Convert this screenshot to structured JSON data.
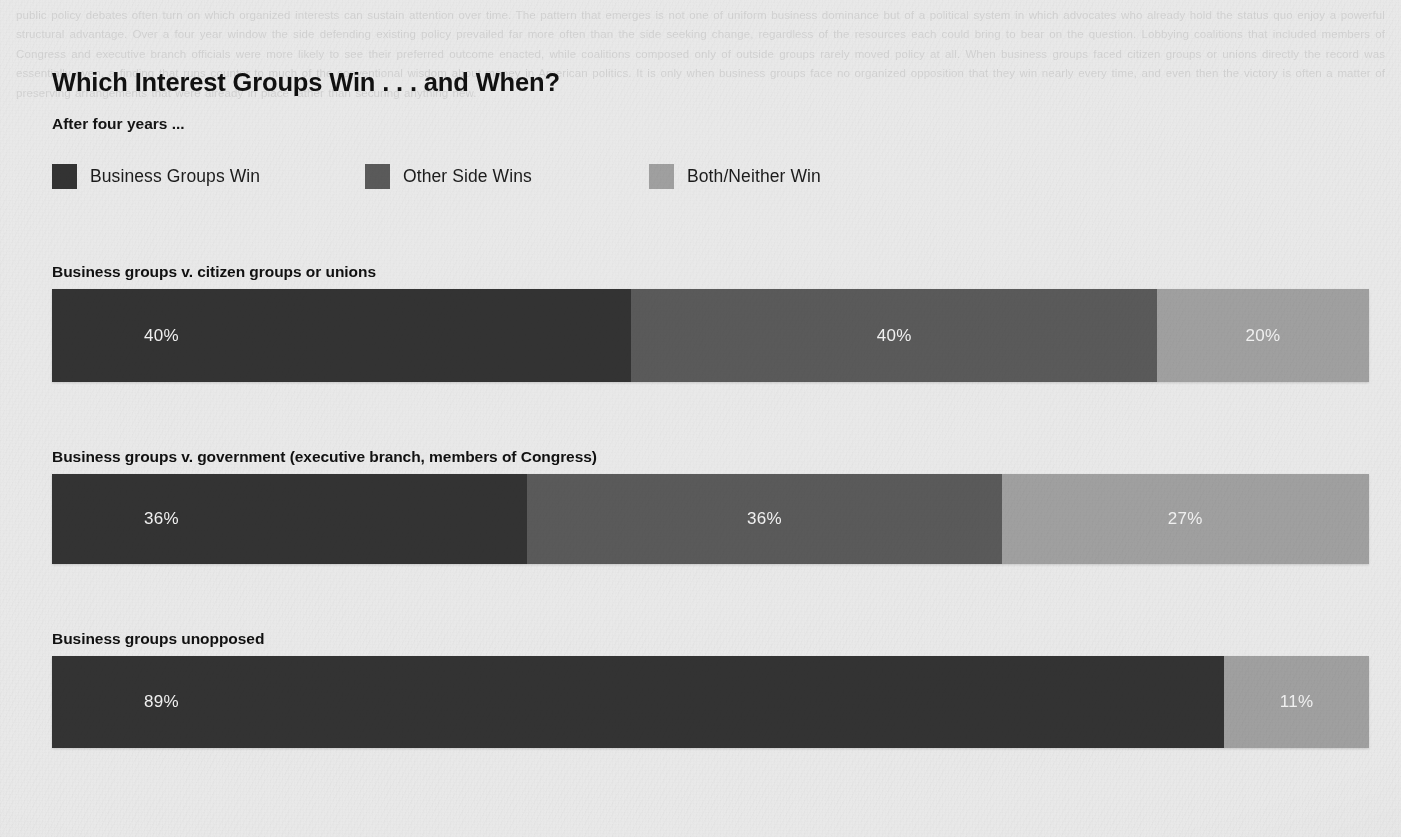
{
  "chart_data": {
    "type": "bar",
    "subtype": "stacked-horizontal-100pct",
    "title": "Which Interest Groups Win . . . and When?",
    "subtitle": "After four years ...",
    "xlabel": "",
    "ylabel": "",
    "xlim": [
      0,
      100
    ],
    "grid": false,
    "legend_position": "top",
    "value_suffix": "%",
    "categories": [
      "Business groups v. citizen groups or unions",
      "Business groups v. government (executive branch, members of Congress)",
      "Business groups unopposed"
    ],
    "series": [
      {
        "name": "Business Groups Win",
        "color": "#333333",
        "values": [
          40,
          36,
          89
        ]
      },
      {
        "name": "Other Side Wins",
        "color": "#5a5a5a",
        "values": [
          40,
          36,
          null
        ]
      },
      {
        "name": "Both/Neither Win",
        "color": "#a0a0a0",
        "values": [
          20,
          27,
          11
        ]
      }
    ],
    "rows": [
      {
        "label": "Business groups v. citizen groups or unions",
        "segments": [
          {
            "series": "Business Groups Win",
            "value": 40,
            "label": "40%",
            "color": "#333333",
            "width_pct": 44.0,
            "label_align": "left"
          },
          {
            "series": "Other Side Wins",
            "value": 40,
            "label": "40%",
            "color": "#5a5a5a",
            "width_pct": 39.9,
            "label_align": "center"
          },
          {
            "series": "Both/Neither Win",
            "value": 20,
            "label": "20%",
            "color": "#a0a0a0",
            "width_pct": 16.1,
            "label_align": "center"
          }
        ]
      },
      {
        "label": "Business groups v. government (executive branch, members of Congress)",
        "segments": [
          {
            "series": "Business Groups Win",
            "value": 36,
            "label": "36%",
            "color": "#333333",
            "width_pct": 36.1,
            "label_align": "left"
          },
          {
            "series": "Other Side Wins",
            "value": 36,
            "label": "36%",
            "color": "#5a5a5a",
            "width_pct": 36.0,
            "label_align": "center"
          },
          {
            "series": "Both/Neither Win",
            "value": 27,
            "label": "27%",
            "color": "#a0a0a0",
            "width_pct": 27.9,
            "label_align": "center"
          }
        ]
      },
      {
        "label": "Business groups unopposed",
        "segments": [
          {
            "series": "Business Groups Win",
            "value": 89,
            "label": "89%",
            "color": "#333333",
            "width_pct": 89.0,
            "label_align": "left"
          },
          {
            "series": "Both/Neither Win",
            "value": 11,
            "label": "11%",
            "color": "#a0a0a0",
            "width_pct": 11.0,
            "label_align": "center"
          }
        ]
      }
    ]
  },
  "legend": {
    "items": [
      {
        "label": "Business Groups Win",
        "color": "#333333"
      },
      {
        "label": "Other Side Wins",
        "color": "#5a5a5a"
      },
      {
        "label": "Both/Neither Win",
        "color": "#a0a0a0"
      }
    ]
  },
  "background": {
    "page_color": "#e9e9e9",
    "ghost_text": "public policy debates often turn on which organized interests can sustain attention over time. The pattern that emerges is not one of uniform business dominance but of a political system in which advocates who already hold the status quo enjoy a powerful structural advantage. Over a four year window the side defending existing policy prevailed far more often than the side seeking change, regardless of the resources each could bring to bear on the question. Lobbying coalitions that included members of Congress and executive branch officials were more likely to see their preferred outcome enacted, while coalitions composed only of outside groups rarely moved policy at all. When business groups faced citizen groups or unions directly the record was essentially even, a finding that runs counter to much of the conventional wisdom about money in American politics. It is only when business groups face no organized opposition that they win nearly every time, and even then the victory is often a matter of preserving arrangements that were already in place rather than securing anything new."
  }
}
